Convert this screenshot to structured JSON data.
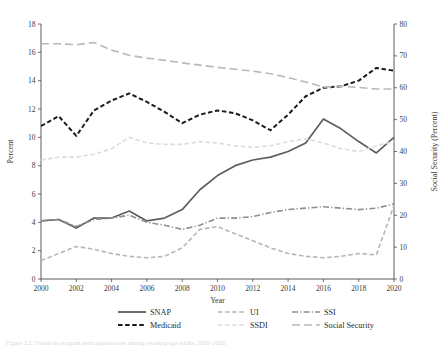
{
  "figure": {
    "caption": "Figure 2.2: Trends in program participation rates among working-age adults, 2000–2020."
  },
  "axes": {
    "left": {
      "title": "Percent",
      "ticks": [
        "0",
        "2",
        "4",
        "6",
        "8",
        "10",
        "12",
        "14",
        "16",
        "18"
      ],
      "min": 0,
      "max": 18
    },
    "right": {
      "title": "Social Security (Percent)",
      "ticks": [
        "0",
        "10",
        "20",
        "30",
        "40",
        "50",
        "60",
        "70",
        "80"
      ],
      "min": 0,
      "max": 80
    },
    "bottom": {
      "title": "Year",
      "ticks": [
        "2000",
        "2002",
        "2004",
        "2006",
        "2008",
        "2010",
        "2012",
        "2014",
        "2016",
        "2018",
        "2020"
      ],
      "min": 2000,
      "max": 2020
    }
  },
  "legend": {
    "items": [
      {
        "label": "SNAP",
        "style": "solid",
        "color": "#5e5e5e"
      },
      {
        "label": "UI",
        "style": "dashed",
        "color": "#b6b6b6"
      },
      {
        "label": "SSI",
        "style": "dash-dot",
        "color": "#8f8f8f"
      },
      {
        "label": "Medicaid",
        "style": "dashed",
        "color": "#1c1c1c"
      },
      {
        "label": "SSDI",
        "style": "dashed",
        "color": "#dcdcdc"
      },
      {
        "label": "Social Security",
        "style": "long-dash",
        "color": "#b9b9b9"
      }
    ]
  },
  "chart_data": {
    "type": "line",
    "title": "",
    "xlabel": "Year",
    "ylabel": "Percent",
    "y2label": "Social Security (Percent)",
    "xlim": [
      2000,
      2020
    ],
    "ylim": [
      0,
      18
    ],
    "y2lim": [
      0,
      80
    ],
    "grid": false,
    "legend_position": "bottom",
    "x": [
      2000,
      2001,
      2002,
      2003,
      2004,
      2005,
      2006,
      2007,
      2008,
      2009,
      2010,
      2011,
      2012,
      2013,
      2014,
      2015,
      2016,
      2017,
      2018,
      2019,
      2020
    ],
    "series": [
      {
        "name": "SNAP",
        "axis": "left",
        "style": "solid",
        "color": "#5e5e5e",
        "values": [
          4.1,
          4.2,
          3.6,
          4.3,
          4.3,
          4.8,
          4.1,
          4.3,
          4.9,
          6.3,
          7.3,
          8.0,
          8.4,
          8.6,
          9.0,
          9.6,
          11.3,
          10.6,
          9.7,
          8.9,
          10.0
        ]
      },
      {
        "name": "UI",
        "axis": "left",
        "style": "dashed",
        "color": "#b6b6b6",
        "values": [
          1.3,
          1.8,
          2.3,
          2.1,
          1.8,
          1.6,
          1.5,
          1.6,
          2.2,
          3.5,
          3.7,
          3.2,
          2.7,
          2.2,
          1.8,
          1.6,
          1.5,
          1.6,
          1.8,
          1.7,
          5.2
        ]
      },
      {
        "name": "SSI",
        "axis": "left",
        "style": "dash-dot",
        "color": "#8f8f8f",
        "values": [
          4.1,
          4.2,
          3.7,
          4.2,
          4.3,
          4.5,
          4.0,
          3.8,
          3.5,
          3.8,
          4.3,
          4.3,
          4.4,
          4.7,
          4.9,
          5.0,
          5.1,
          5.0,
          4.9,
          5.0,
          5.3
        ]
      },
      {
        "name": "Medicaid",
        "axis": "left",
        "style": "dashed",
        "color": "#1c1c1c",
        "values": [
          10.8,
          11.5,
          10.1,
          11.9,
          12.6,
          13.1,
          12.5,
          11.8,
          11.0,
          11.6,
          11.9,
          11.7,
          11.2,
          10.5,
          11.6,
          12.9,
          13.5,
          13.6,
          14.0,
          14.9,
          14.7
        ]
      },
      {
        "name": "SSDI",
        "axis": "left",
        "style": "dashed",
        "color": "#dcdcdc",
        "values": [
          8.4,
          8.6,
          8.6,
          8.8,
          9.2,
          10.0,
          9.6,
          9.5,
          9.5,
          9.7,
          9.6,
          9.4,
          9.3,
          9.4,
          9.7,
          9.9,
          9.6,
          9.2,
          9.0,
          9.4,
          9.7
        ]
      },
      {
        "name": "Social Security",
        "axis": "right",
        "style": "long-dash",
        "color": "#b9b9b9",
        "values": [
          73.8,
          73.8,
          73.5,
          74.2,
          71.8,
          70.2,
          69.3,
          68.6,
          67.8,
          67.1,
          66.4,
          65.8,
          65.2,
          64.4,
          63.2,
          61.8,
          60.2,
          60.5,
          60.1,
          59.6,
          59.6
        ]
      }
    ]
  }
}
